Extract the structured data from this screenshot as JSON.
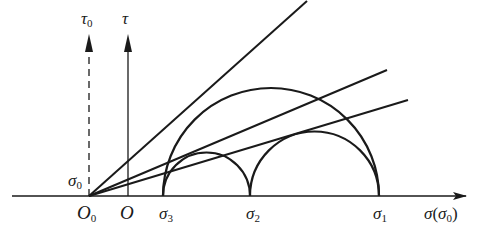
{
  "diagram": {
    "type": "mohr-circle",
    "stroke_color": "#1a1a1a",
    "axes": {
      "horizontal": {
        "label": "σ",
        "sub_label": "(σ",
        "sub_index": "0",
        "close": ")"
      },
      "tau0": {
        "label": "τ",
        "index": "0",
        "style": "dashed"
      },
      "tau": {
        "label": "τ",
        "style": "solid"
      }
    },
    "origins": {
      "o0": {
        "label": "O",
        "index": "0"
      },
      "o": {
        "label": "O"
      }
    },
    "points": {
      "sigma3": {
        "label": "σ",
        "index": "3"
      },
      "sigma2": {
        "label": "σ",
        "index": "2"
      },
      "sigma1": {
        "label": "σ",
        "index": "1"
      },
      "sigma0": {
        "label": "σ",
        "index": "0"
      }
    },
    "circles": [
      {
        "name": "circle-sigma3-sigma1",
        "from": "σ3",
        "to": "σ1"
      },
      {
        "name": "circle-sigma3-sigma2",
        "from": "σ3",
        "to": "σ2"
      },
      {
        "name": "circle-sigma2-sigma1",
        "from": "σ2",
        "to": "σ1"
      }
    ],
    "envelope_lines": [
      {
        "name": "tangent-line-sigma3-sigma1",
        "tangent_to": "circle σ3–σ1"
      },
      {
        "name": "tangent-line-sigma3-sigma2",
        "tangent_to": "circle σ3–σ2"
      },
      {
        "name": "tangent-line-sigma2-sigma1",
        "tangent_to": "circle σ2–σ1"
      }
    ]
  }
}
